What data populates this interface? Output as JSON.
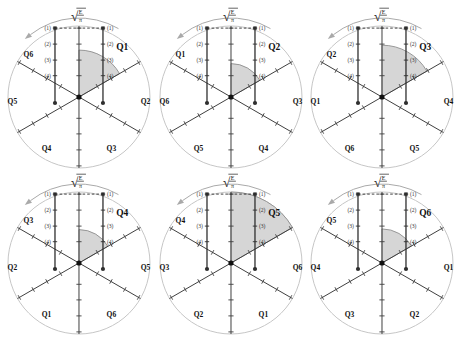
{
  "figure": {
    "background": "#ffffff",
    "formula": {
      "radical": "√",
      "numerator": "E",
      "denominator": "π"
    },
    "level_labels": [
      "(1)",
      "(2)",
      "(3)",
      "(4)"
    ],
    "icons": {
      "rotation_arrow": "counterclockwise-arc-arrow-icon"
    },
    "colors": {
      "circle": "#c6c6c6",
      "spoke": "#3f3f3f",
      "shade_fill": "#d6d6d6",
      "shade_edge": "#8f8f8f",
      "bar": "#2f2f2f",
      "dashed": "#2b2b2b",
      "arrow": "#a9a9a9",
      "label": "#111111",
      "level_label": "#333333"
    },
    "diagrams": [
      {
        "id": "q1",
        "highlight": "Q1",
        "shade_radius_fraction": 0.66,
        "labels": {
          "upper_right": "Q1",
          "upper_left": "Q6",
          "left": "Q5",
          "right": "Q2",
          "bottom_left": "Q4",
          "bottom_right": "Q3"
        }
      },
      {
        "id": "q2",
        "highlight": "Q2",
        "shade_radius_fraction": 0.47,
        "labels": {
          "upper_right": "Q2",
          "upper_left": "Q1",
          "left": "Q6",
          "right": "Q3",
          "bottom_left": "Q5",
          "bottom_right": "Q4"
        }
      },
      {
        "id": "q3",
        "highlight": "Q3",
        "shade_radius_fraction": 0.73,
        "labels": {
          "upper_right": "Q3",
          "upper_left": "Q2",
          "left": "Q1",
          "right": "Q4",
          "bottom_left": "Q6",
          "bottom_right": "Q5"
        }
      },
      {
        "id": "q4",
        "highlight": "Q4",
        "shade_radius_fraction": 0.47,
        "labels": {
          "upper_right": "Q4",
          "upper_left": "Q3",
          "left": "Q2",
          "right": "Q5",
          "bottom_left": "Q1",
          "bottom_right": "Q6"
        }
      },
      {
        "id": "q5",
        "highlight": "Q5",
        "shade_radius_fraction": 1.0,
        "labels": {
          "upper_right": "Q5",
          "upper_left": "Q4",
          "left": "Q3",
          "right": "Q6",
          "bottom_left": "Q2",
          "bottom_right": "Q1"
        }
      },
      {
        "id": "q6",
        "highlight": "Q6",
        "shade_radius_fraction": 0.48,
        "labels": {
          "upper_right": "Q6",
          "upper_left": "Q5",
          "left": "Q4",
          "right": "Q1",
          "bottom_left": "Q3",
          "bottom_right": "Q2"
        }
      }
    ]
  }
}
